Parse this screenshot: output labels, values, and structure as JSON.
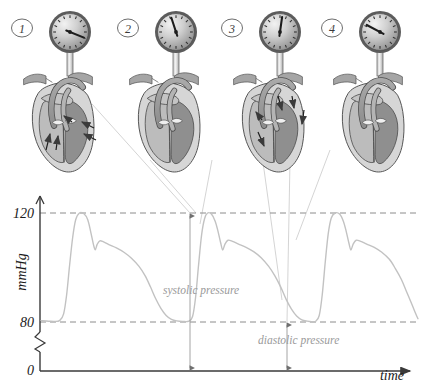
{
  "figure": {
    "background": "#ffffff",
    "line_color": "#b9b9b9",
    "axis_color": "#3a3a3a",
    "label_color": "#1a1a1a",
    "annotation_color": "#9a9a9a",
    "gridline_color": "#8c8c8c"
  },
  "panels": [
    {
      "number": "1",
      "name": "panel-1",
      "gauge_needle_deg": 112,
      "caption": "",
      "x": 8
    },
    {
      "number": "2",
      "name": "panel-2",
      "gauge_needle_deg": -18,
      "caption": "",
      "x": 114
    },
    {
      "number": "3",
      "name": "panel-3",
      "gauge_needle_deg": 8,
      "caption": "",
      "x": 218
    },
    {
      "number": "4",
      "name": "panel-4",
      "gauge_needle_deg": -62,
      "caption": "",
      "x": 318
    }
  ],
  "chart_data": {
    "type": "line",
    "title": "",
    "xlabel": "time",
    "ylabel": "mmHg",
    "ylim": [
      0,
      135
    ],
    "xlim": [
      0,
      100
    ],
    "grid": true,
    "gridlines": [
      {
        "value": 120,
        "label": "120",
        "style": "dashed"
      },
      {
        "value": 80,
        "label": "80",
        "style": "dashed"
      }
    ],
    "ytick_labels": [
      "120",
      "80",
      "0"
    ],
    "ytick_values": [
      120,
      80,
      0
    ],
    "axis_break": true,
    "axis_break_between": [
      0,
      80
    ],
    "series": [
      {
        "name": "arterial pressure",
        "color": "#c2c2c2",
        "points": [
          [
            0.0,
            80.5
          ],
          [
            2.0,
            80.3
          ],
          [
            3.6,
            80.2
          ],
          [
            5.0,
            80.6
          ],
          [
            6.0,
            83.0
          ],
          [
            6.8,
            90.0
          ],
          [
            7.6,
            101.0
          ],
          [
            8.4,
            111.0
          ],
          [
            9.2,
            117.5
          ],
          [
            10.2,
            120.0
          ],
          [
            11.4,
            119.7
          ],
          [
            12.4,
            117.5
          ],
          [
            13.2,
            113.0
          ],
          [
            13.9,
            108.5
          ],
          [
            14.4,
            106.5
          ],
          [
            14.9,
            108.5
          ],
          [
            15.6,
            109.8
          ],
          [
            16.6,
            109.4
          ],
          [
            18.0,
            108.4
          ],
          [
            20.0,
            107.2
          ],
          [
            22.0,
            105.6
          ],
          [
            24.0,
            103.4
          ],
          [
            26.0,
            100.4
          ],
          [
            27.6,
            97.0
          ],
          [
            29.0,
            93.0
          ],
          [
            30.4,
            88.6
          ],
          [
            31.8,
            85.0
          ],
          [
            33.2,
            82.4
          ],
          [
            34.6,
            81.0
          ],
          [
            36.0,
            80.4
          ],
          [
            37.6,
            80.2
          ],
          [
            39.2,
            80.3
          ],
          [
            40.2,
            82.0
          ],
          [
            41.0,
            89.0
          ],
          [
            41.8,
            101.0
          ],
          [
            42.6,
            112.0
          ],
          [
            43.4,
            118.0
          ],
          [
            44.2,
            120.0
          ],
          [
            45.2,
            119.6
          ],
          [
            46.2,
            117.0
          ],
          [
            47.0,
            113.0
          ],
          [
            47.7,
            108.8
          ],
          [
            48.2,
            106.4
          ],
          [
            48.8,
            108.6
          ],
          [
            49.6,
            110.0
          ],
          [
            50.8,
            109.6
          ],
          [
            52.4,
            108.6
          ],
          [
            54.4,
            107.4
          ],
          [
            56.4,
            105.8
          ],
          [
            58.4,
            103.6
          ],
          [
            60.4,
            100.4
          ],
          [
            62.0,
            97.0
          ],
          [
            63.6,
            92.8
          ],
          [
            65.0,
            88.4
          ],
          [
            66.4,
            84.8
          ],
          [
            67.8,
            82.2
          ],
          [
            69.2,
            80.8
          ],
          [
            70.6,
            80.3
          ],
          [
            71.8,
            80.1
          ],
          [
            72.8,
            80.2
          ],
          [
            73.8,
            82.4
          ],
          [
            74.6,
            90.0
          ],
          [
            75.4,
            102.0
          ],
          [
            76.2,
            112.5
          ],
          [
            77.0,
            118.2
          ],
          [
            78.0,
            120.0
          ],
          [
            79.2,
            119.6
          ],
          [
            80.2,
            117.0
          ],
          [
            81.0,
            113.0
          ],
          [
            81.7,
            108.8
          ],
          [
            82.2,
            106.4
          ],
          [
            82.8,
            108.6
          ],
          [
            83.6,
            110.0
          ],
          [
            84.8,
            109.6
          ],
          [
            86.4,
            108.6
          ],
          [
            88.4,
            107.4
          ],
          [
            90.4,
            105.6
          ],
          [
            92.4,
            103.0
          ],
          [
            94.0,
            99.6
          ],
          [
            95.6,
            95.6
          ],
          [
            97.0,
            91.0
          ],
          [
            98.4,
            86.4
          ],
          [
            99.4,
            83.0
          ],
          [
            100.0,
            81.2
          ]
        ]
      }
    ],
    "annotations": [
      {
        "name": "systolic-pressure",
        "text": "systolic pressure",
        "x": 44.2,
        "value": 120,
        "arrow": "double",
        "from_value": 0,
        "to_value": 120
      },
      {
        "name": "diastolic-pressure",
        "text": "diastolic pressure",
        "x": 72.4,
        "value": 80,
        "arrow": "double",
        "from_value": 0,
        "to_value": 80
      }
    ]
  },
  "axes": {
    "y_label": "mmHg",
    "x_label": "time",
    "zero_label": "0",
    "tick_120": "120",
    "tick_80": "80"
  }
}
